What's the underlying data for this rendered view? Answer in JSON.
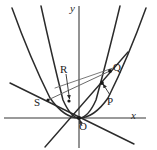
{
  "figure": {
    "background_color": "#ffffff",
    "stroke_color": "#2b2b2b",
    "axis_color": "#6e6e6e",
    "width": 157,
    "height": 150
  },
  "axes": {
    "x_label": "x",
    "y_label": "y",
    "origin_label": "O",
    "x_axis_y_pixel": 118,
    "y_axis_x_pixel": 79,
    "origin": {
      "x": 79,
      "y": 118
    }
  },
  "points": [
    {
      "name": "O",
      "label": "O",
      "x": 79,
      "y": 118,
      "label_x": 80,
      "label_y": 121,
      "has_leader": true,
      "marked": true
    },
    {
      "name": "P",
      "label": "P",
      "x": 102,
      "y": 83,
      "label_x": 107,
      "label_y": 97,
      "has_leader": true,
      "marked": true
    },
    {
      "name": "Q",
      "label": "Q",
      "x": 110,
      "y": 71,
      "label_x": 113,
      "label_y": 63,
      "has_leader": false,
      "marked": true
    },
    {
      "name": "R",
      "label": "R",
      "x": 69,
      "y": 101,
      "label_x": 61,
      "label_y": 66,
      "has_leader": true,
      "marked": true
    },
    {
      "name": "S",
      "label": "S",
      "x": 48,
      "y": 100,
      "label_x": 35,
      "label_y": 98,
      "has_leader": false,
      "marked": true
    }
  ],
  "curves": [
    {
      "name": "parabola-wide",
      "type": "parabola",
      "description": "wider upward parabola with vertex at the origin",
      "vertex": {
        "x": 79,
        "y": 118
      },
      "color": "#2b2b2b"
    },
    {
      "name": "parabola-narrow",
      "type": "parabola",
      "description": "narrower upward parabola with vertex at the origin",
      "vertex": {
        "x": 79,
        "y": 118
      },
      "color": "#2b2b2b"
    }
  ],
  "lines": [
    {
      "name": "line-through-origin-steep",
      "type": "line",
      "description": "line through the origin rising to the upper right toward Q and falling to the lower left",
      "color": "#2b2b2b"
    },
    {
      "name": "line-through-origin-shallow",
      "type": "line",
      "description": "line through the origin rising to the upper left past S and falling to the lower right",
      "color": "#2b2b2b"
    },
    {
      "name": "chord-S-Q",
      "type": "segment",
      "description": "chord joining S to Q",
      "color": "#5a5a5a"
    },
    {
      "name": "chord-R-Q",
      "type": "segment",
      "description": "chord joining R to Q",
      "color": "#5a5a5a"
    }
  ]
}
